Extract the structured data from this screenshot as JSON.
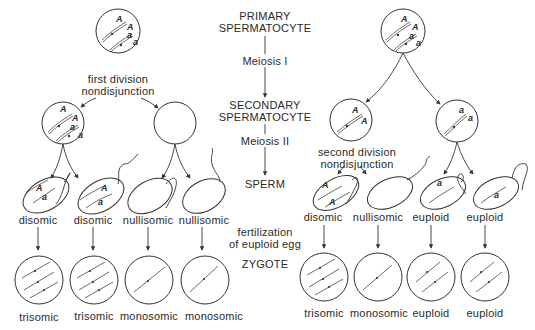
{
  "center_column": {
    "primary": [
      "PRIMARY",
      "SPERMATOCYTE"
    ],
    "meiosis1": "Meiosis I",
    "secondary": [
      "SECONDARY",
      "SPERMATOCYTE"
    ],
    "meiosis2": "Meiosis II",
    "sperm": "SPERM",
    "fertilization": [
      "fertilization",
      "of euploid egg"
    ],
    "zygote": "ZYGOTE"
  },
  "left_panel": {
    "event": [
      "first division",
      "nondisjunction"
    ],
    "sperm_labels": [
      "disomic",
      "disomic",
      "nullisomic",
      "nullisomic"
    ],
    "zygote_labels": [
      "trisomic",
      "trisomic",
      "monosomic",
      "monosomic"
    ]
  },
  "right_panel": {
    "event": [
      "second division",
      "nondisjunction"
    ],
    "sperm_labels": [
      "disomic",
      "nullisomic",
      "euploid",
      "euploid"
    ],
    "zygote_labels": [
      "trisomic",
      "monosomic",
      "euploid",
      "euploid"
    ]
  },
  "alleles": {
    "dominant": "A",
    "recessive": "a"
  }
}
